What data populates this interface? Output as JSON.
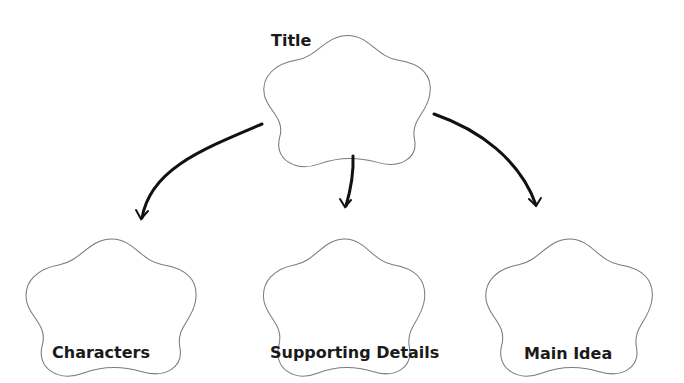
{
  "diagram": {
    "type": "graphic-organizer",
    "stroke_color": "#7a7a7a",
    "arrow_color": "#111111",
    "nodes": [
      {
        "id": "title",
        "label": "Title"
      },
      {
        "id": "characters",
        "label": "Characters"
      },
      {
        "id": "supporting",
        "label": "Supporting Details"
      },
      {
        "id": "main",
        "label": "Main Idea"
      }
    ],
    "edges": [
      {
        "from": "title",
        "to": "characters"
      },
      {
        "from": "title",
        "to": "supporting"
      },
      {
        "from": "title",
        "to": "main"
      }
    ]
  }
}
